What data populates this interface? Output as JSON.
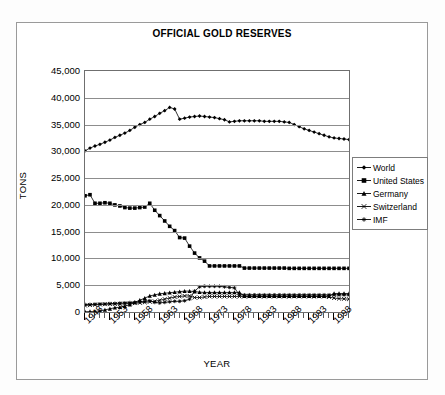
{
  "chart_data": {
    "type": "line",
    "title": "OFFICIAL GOLD RESERVES",
    "xlabel": "YEAR",
    "ylabel": "TONS",
    "ylim": [
      0,
      45000
    ],
    "ytick_labels": [
      "45,000",
      "40,000",
      "35,000",
      "30,000",
      "25,000",
      "20,000",
      "15,000",
      "10,000",
      "5,000",
      "0"
    ],
    "ytick_values": [
      45000,
      40000,
      35000,
      30000,
      25000,
      20000,
      15000,
      10000,
      5000,
      0
    ],
    "xtick_labels": [
      "1948",
      "1953",
      "1958",
      "1963",
      "1968",
      "1973",
      "1978",
      "1983",
      "1988",
      "1993",
      "1998"
    ],
    "xtick_values": [
      1948,
      1953,
      1958,
      1963,
      1968,
      1973,
      1978,
      1983,
      1988,
      1993,
      1998
    ],
    "grid": true,
    "legend_position": "right",
    "x": [
      1948,
      1949,
      1950,
      1951,
      1952,
      1953,
      1954,
      1955,
      1956,
      1957,
      1958,
      1959,
      1960,
      1961,
      1962,
      1963,
      1964,
      1965,
      1966,
      1967,
      1968,
      1969,
      1970,
      1971,
      1972,
      1973,
      1974,
      1975,
      1976,
      1977,
      1978,
      1979,
      1980,
      1981,
      1982,
      1983,
      1984,
      1985,
      1986,
      1987,
      1988,
      1989,
      1990,
      1991,
      1992,
      1993,
      1994,
      1995,
      1996,
      1997,
      1998,
      1999,
      2000,
      2001
    ],
    "series": [
      {
        "name": "World",
        "marker": "diamond",
        "values": [
          30100,
          30600,
          31000,
          31300,
          31700,
          32100,
          32600,
          33000,
          33400,
          33900,
          34500,
          35000,
          35400,
          36000,
          36500,
          37100,
          37600,
          38200,
          37900,
          36000,
          36200,
          36400,
          36500,
          36600,
          36500,
          36400,
          36300,
          36100,
          35900,
          35500,
          35600,
          35700,
          35700,
          35700,
          35700,
          35700,
          35600,
          35600,
          35600,
          35600,
          35500,
          35400,
          35000,
          34600,
          34200,
          33900,
          33600,
          33300,
          33000,
          32700,
          32500,
          32400,
          32300,
          32200
        ]
      },
      {
        "name": "United States",
        "marker": "square",
        "values": [
          21700,
          21900,
          20300,
          20300,
          20400,
          20300,
          20000,
          19800,
          19500,
          19400,
          19400,
          19500,
          19600,
          20300,
          19000,
          18000,
          17000,
          16000,
          15200,
          13900,
          13800,
          12300,
          11000,
          10100,
          9500,
          8600,
          8600,
          8600,
          8600,
          8600,
          8600,
          8600,
          8200,
          8200,
          8200,
          8200,
          8200,
          8200,
          8200,
          8200,
          8200,
          8150,
          8150,
          8150,
          8150,
          8150,
          8150,
          8150,
          8150,
          8150,
          8150,
          8150,
          8150,
          8150
        ]
      },
      {
        "name": "Germany",
        "marker": "triangle",
        "values": [
          50,
          80,
          120,
          200,
          400,
          600,
          800,
          900,
          1100,
          1400,
          1800,
          2200,
          2600,
          3000,
          3200,
          3400,
          3500,
          3600,
          3700,
          3800,
          3900,
          3900,
          3800,
          3700,
          3650,
          3650,
          3650,
          3650,
          3650,
          3650,
          3650,
          3650,
          2960,
          2960,
          2960,
          2960,
          2960,
          2960,
          2960,
          2960,
          2960,
          2960,
          2960,
          2960,
          2960,
          2960,
          2960,
          2960,
          2960,
          2960,
          3460,
          3460,
          3460,
          3450
        ]
      },
      {
        "name": "Switzerland",
        "marker": "cross",
        "values": [
          1200,
          1300,
          1350,
          1400,
          1450,
          1500,
          1500,
          1500,
          1550,
          1600,
          1650,
          1700,
          1800,
          1900,
          2000,
          2200,
          2400,
          2600,
          2800,
          2900,
          3000,
          3000,
          2700,
          2700,
          2800,
          2900,
          2900,
          2900,
          2900,
          2900,
          2900,
          2900,
          2900,
          2900,
          2900,
          2900,
          2900,
          2900,
          2900,
          2900,
          2900,
          2900,
          2900,
          2900,
          2900,
          2900,
          2900,
          2900,
          2900,
          2800,
          2600,
          2500,
          2450,
          2400
        ]
      },
      {
        "name": "IMF",
        "marker": "asterisk",
        "values": [
          1400,
          1400,
          1450,
          1500,
          1500,
          1550,
          1600,
          1650,
          1700,
          1750,
          1800,
          1900,
          2000,
          2100,
          1800,
          1700,
          1800,
          1900,
          2000,
          2000,
          2100,
          2400,
          3900,
          4700,
          4800,
          4800,
          4800,
          4800,
          4700,
          4600,
          4500,
          3200,
          3200,
          3200,
          3200,
          3200,
          3200,
          3200,
          3200,
          3200,
          3200,
          3200,
          3200,
          3200,
          3200,
          3200,
          3200,
          3200,
          3200,
          3200,
          3200,
          3200,
          3200,
          3200
        ]
      }
    ]
  },
  "legend": {
    "items": [
      {
        "label": "World"
      },
      {
        "label": "United States"
      },
      {
        "label": "Germany"
      },
      {
        "label": "Switzerland"
      },
      {
        "label": "IMF"
      }
    ]
  }
}
